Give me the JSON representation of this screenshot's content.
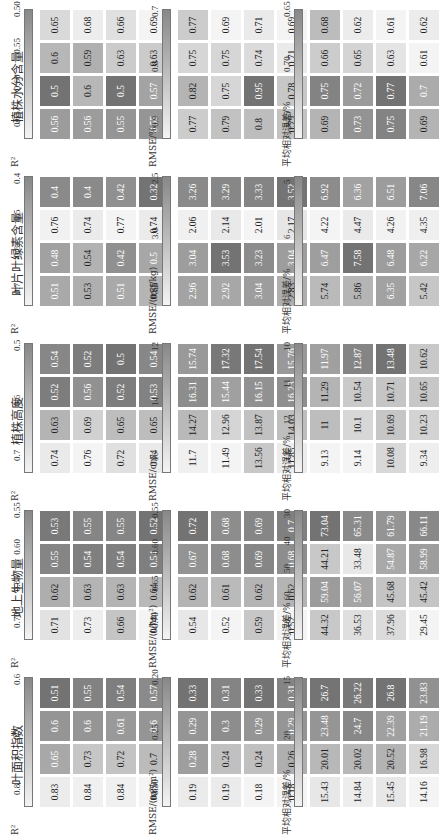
{
  "chart_data": {
    "type": "heatmap",
    "title": "",
    "models": [
      "多元线性回归",
      "随机森林",
      "神经网络",
      "支持向量机"
    ],
    "sensors": [
      "LiDAR",
      "RGB",
      "HS",
      "TM"
    ],
    "panels": [
      {
        "trait": "叶面积指数",
        "r2": {
          "label": "R²",
          "ticks": [
            "0.8",
            "0.7",
            "0.6"
          ],
          "values": {
            "LiDAR": [
              0.83,
              0.84,
              0.84,
              0.85
            ],
            "RGB": [
              0.65,
              0.73,
              0.72,
              0.7
            ],
            "HS": [
              0.6,
              0.6,
              0.61,
              0.6
            ],
            "TM": [
              0.51,
              0.55,
              0.54,
              0.57
            ]
          }
        },
        "rmse": {
          "label": "RMSE/(m²/m²)",
          "ticks": [
            "0.30",
            "0.25",
            "0.20"
          ],
          "values": {
            "LiDAR": [
              0.19,
              0.19,
              0.18,
              0.18
            ],
            "RGB": [
              0.28,
              0.24,
              0.24,
              0.26
            ],
            "HS": [
              0.29,
              0.3,
              0.29,
              0.29
            ],
            "TM": [
              0.33,
              0.31,
              0.33,
              0.31
            ]
          }
        },
        "mre": {
          "label": "平均相对误差/%",
          "ticks": [
            "25",
            "20",
            "15"
          ],
          "values": {
            "LiDAR": [
              15.43,
              14.84,
              15.45,
              14.16
            ],
            "RGB": [
              20.01,
              20.02,
              20.52,
              16.98
            ],
            "HS": [
              23.48,
              24.7,
              22.39,
              21.19
            ],
            "TM": [
              26.7,
              26.22,
              26.8,
              23.83
            ]
          }
        }
      },
      {
        "trait": "地上生物量",
        "r2": {
          "label": "R²",
          "ticks": [
            "0.70",
            "0.65",
            "0.60",
            "0.55"
          ],
          "values": {
            "LiDAR": [
              0.71,
              0.73,
              0.66,
              0.74
            ],
            "RGB": [
              0.62,
              0.63,
              0.63,
              0.64
            ],
            "HS": [
              0.55,
              0.54,
              0.54,
              0.54
            ],
            "TM": [
              0.53,
              0.55,
              0.55,
              0.52
            ]
          }
        },
        "rmse": {
          "label": "RMSE/(t/hm²)",
          "ticks": [
            "0.70",
            "0.65",
            "0.60",
            "0.55"
          ],
          "values": {
            "LiDAR": [
              0.54,
              0.52,
              0.59,
              0.52
            ],
            "RGB": [
              0.62,
              0.61,
              0.62,
              0.62
            ],
            "HS": [
              0.67,
              0.68,
              0.69,
              0.68
            ],
            "TM": [
              0.72,
              0.68,
              0.69,
              0.7
            ]
          }
        },
        "mre": {
          "label": "平均相对误差/%",
          "ticks": [
            "70",
            "60",
            "50",
            "40",
            "30"
          ],
          "values": {
            "LiDAR": [
              44.32,
              36.53,
              37.96,
              29.45
            ],
            "RGB": [
              59.04,
              56.07,
              45.68,
              45.42
            ],
            "HS": [
              44.21,
              33.48,
              54.87,
              58.99
            ],
            "TM": [
              73.04,
              65.31,
              61.79,
              66.11
            ]
          }
        }
      },
      {
        "trait": "植株高度",
        "r2": {
          "label": "R²",
          "ticks": [
            "0.7",
            "0.6",
            "0.5"
          ],
          "values": {
            "LiDAR": [
              0.74,
              0.76,
              0.72,
              0.74
            ],
            "RGB": [
              0.63,
              0.69,
              0.65,
              0.65
            ],
            "HS": [
              0.52,
              0.56,
              0.52,
              0.53
            ],
            "TM": [
              0.54,
              0.52,
              0.5,
              0.54
            ]
          }
        },
        "rmse": {
          "label": "RMSE/cm",
          "ticks": [
            "16",
            "14",
            "12"
          ],
          "values": {
            "LiDAR": [
              11.7,
              11.49,
              13.56,
              11.85
            ],
            "RGB": [
              14.27,
              12.96,
              13.87,
              14.03
            ],
            "HS": [
              16.31,
              15.44,
              16.15,
              16.23
            ],
            "TM": [
              15.74,
              17.32,
              17.54,
              15.76
            ]
          }
        },
        "mre": {
          "label": "平均相对误差/%",
          "ticks": [
            "13",
            "12",
            "11",
            "10"
          ],
          "values": {
            "LiDAR": [
              9.13,
              9.14,
              10.08,
              9.34
            ],
            "RGB": [
              11.0,
              10.1,
              10.69,
              10.23
            ],
            "HS": [
              11.29,
              10.54,
              10.71,
              10.65
            ],
            "TM": [
              11.97,
              12.87,
              13.48,
              10.62
            ]
          }
        }
      },
      {
        "trait": "叶片叶绿素含量",
        "r2": {
          "label": "R²",
          "ticks": [
            "0.7",
            "0.6",
            "0.5",
            "0.4"
          ],
          "values": {
            "LiDAR": [
              0.51,
              0.53,
              0.51,
              0.55
            ],
            "RGB": [
              0.48,
              0.54,
              0.42,
              0.5
            ],
            "HS": [
              0.76,
              0.74,
              0.77,
              0.74
            ],
            "TM": [
              0.4,
              0.4,
              0.42,
              0.32
            ]
          }
        },
        "rmse": {
          "label": "RMSE/(mg/kg)",
          "ticks": [
            "3.5",
            "3.0",
            "2.5"
          ],
          "values": {
            "LiDAR": [
              2.96,
              2.92,
              3.04,
              2.83
            ],
            "RGB": [
              3.04,
              3.53,
              3.23,
              3.04
            ],
            "HS": [
              2.06,
              2.14,
              2.01,
              2.17
            ],
            "TM": [
              3.26,
              3.29,
              3.33,
              3.52
            ]
          }
        },
        "mre": {
          "label": "平均相对误差/%",
          "ticks": [
            "7",
            "6",
            "5"
          ],
          "values": {
            "LiDAR": [
              5.74,
              5.86,
              6.35,
              5.42
            ],
            "RGB": [
              6.47,
              7.58,
              6.48,
              6.22
            ],
            "HS": [
              4.22,
              4.47,
              4.26,
              4.35
            ],
            "TM": [
              6.92,
              6.36,
              6.51,
              7.06
            ]
          }
        }
      },
      {
        "trait": "植株水分含量",
        "r2": {
          "label": "R²",
          "ticks": [
            "0.65",
            "0.60",
            "0.55",
            "0.50"
          ],
          "values": {
            "LiDAR": [
              0.56,
              0.56,
              0.55,
              0.55
            ],
            "RGB": [
              0.5,
              0.6,
              0.5,
              0.57
            ],
            "HS": [
              0.6,
              0.59,
              0.63,
              0.63
            ],
            "TM": [
              0.65,
              0.68,
              0.66,
              0.69
            ]
          }
        },
        "rmse": {
          "label": "RMSE/%",
          "ticks": [
            "0.9",
            "0.8",
            "0.7"
          ],
          "values": {
            "LiDAR": [
              0.77,
              0.79,
              0.8,
              0.79
            ],
            "RGB": [
              0.82,
              0.75,
              0.95,
              0.78
            ],
            "HS": [
              0.75,
              0.75,
              0.74,
              0.71
            ],
            "TM": [
              0.77,
              0.69,
              0.71,
              0.69
            ]
          }
        },
        "mre": {
          "label": "平均相对误差/%",
          "ticks": [
            "0.75",
            "0.70",
            "0.65"
          ],
          "values": {
            "LiDAR": [
              0.69,
              0.73,
              0.75,
              0.69
            ],
            "RGB": [
              0.75,
              0.72,
              0.77,
              0.7
            ],
            "HS": [
              0.66,
              0.65,
              0.63,
              0.61
            ],
            "TM": [
              0.68,
              0.62,
              0.61,
              0.62
            ]
          }
        }
      }
    ],
    "colormap": {
      "low": "#f4f4f4",
      "high": "#7a7a7a"
    }
  }
}
